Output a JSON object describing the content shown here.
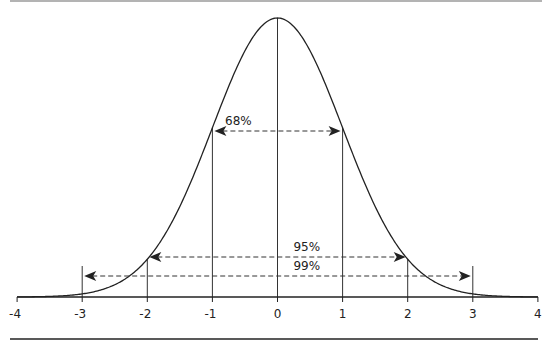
{
  "chart_data": {
    "type": "line",
    "title": "",
    "xlabel": "",
    "ylabel": "",
    "xlim": [
      -4,
      4
    ],
    "x_ticks": [
      "-4",
      "-3",
      "-2",
      "-1",
      "0",
      "1",
      "2",
      "3",
      "4"
    ],
    "grid": false,
    "vertical_lines_at": [
      -3,
      -2,
      -1,
      0,
      1,
      2,
      3
    ],
    "intervals": [
      {
        "label": "68%",
        "from": -1,
        "to": 1
      },
      {
        "label": "95%",
        "from": -2,
        "to": 2
      },
      {
        "label": "99%",
        "from": -3,
        "to": 3
      }
    ],
    "series": [
      {
        "name": "Normal density",
        "mean": 0,
        "sd": 1
      }
    ]
  },
  "colors": {
    "line": "#222222",
    "rule_top": "#888888",
    "rule_bottom": "#222222"
  }
}
